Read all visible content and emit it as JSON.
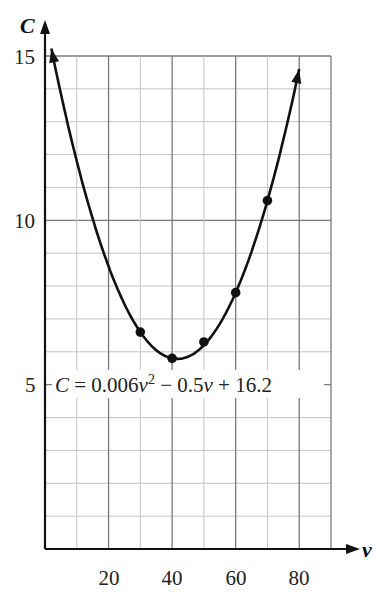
{
  "chart_data": {
    "type": "line",
    "title": "",
    "xlabel": "v",
    "ylabel": "C",
    "xlim": [
      0,
      90
    ],
    "ylim": [
      0,
      15
    ],
    "x_ticks": [
      20,
      40,
      60,
      80
    ],
    "y_ticks": [
      5,
      10,
      15
    ],
    "grid": true,
    "grid_minor_x": 10,
    "grid_minor_y": 1,
    "equation_label": "C = 0.006v² − 0.5v + 16.2",
    "curve": {
      "a": 0.006,
      "b": -0.5,
      "c": 16.2,
      "v_range": [
        2,
        80
      ]
    },
    "series": [
      {
        "name": "data points",
        "x": [
          30,
          40,
          50,
          60,
          70
        ],
        "y": [
          6.6,
          5.8,
          6.3,
          7.8,
          10.6
        ]
      }
    ],
    "legend": null
  },
  "labels": {
    "y_axis": "C",
    "x_axis": "v",
    "y_tick_5": "5",
    "y_tick_10": "10",
    "y_tick_15": "15",
    "x_tick_20": "20",
    "x_tick_40": "40",
    "x_tick_60": "60",
    "x_tick_80": "80",
    "eq_c": "C",
    "eq_mid": " = 0.006",
    "eq_v1": "v",
    "eq_sup": "2",
    "eq_rest": " − 0.5",
    "eq_v2": "v",
    "eq_end": " + 16.2"
  },
  "colors": {
    "curve": "#111111",
    "grid_major": "#7a7a7a",
    "grid_minor": "#c4c4c4",
    "axis": "#111111"
  }
}
